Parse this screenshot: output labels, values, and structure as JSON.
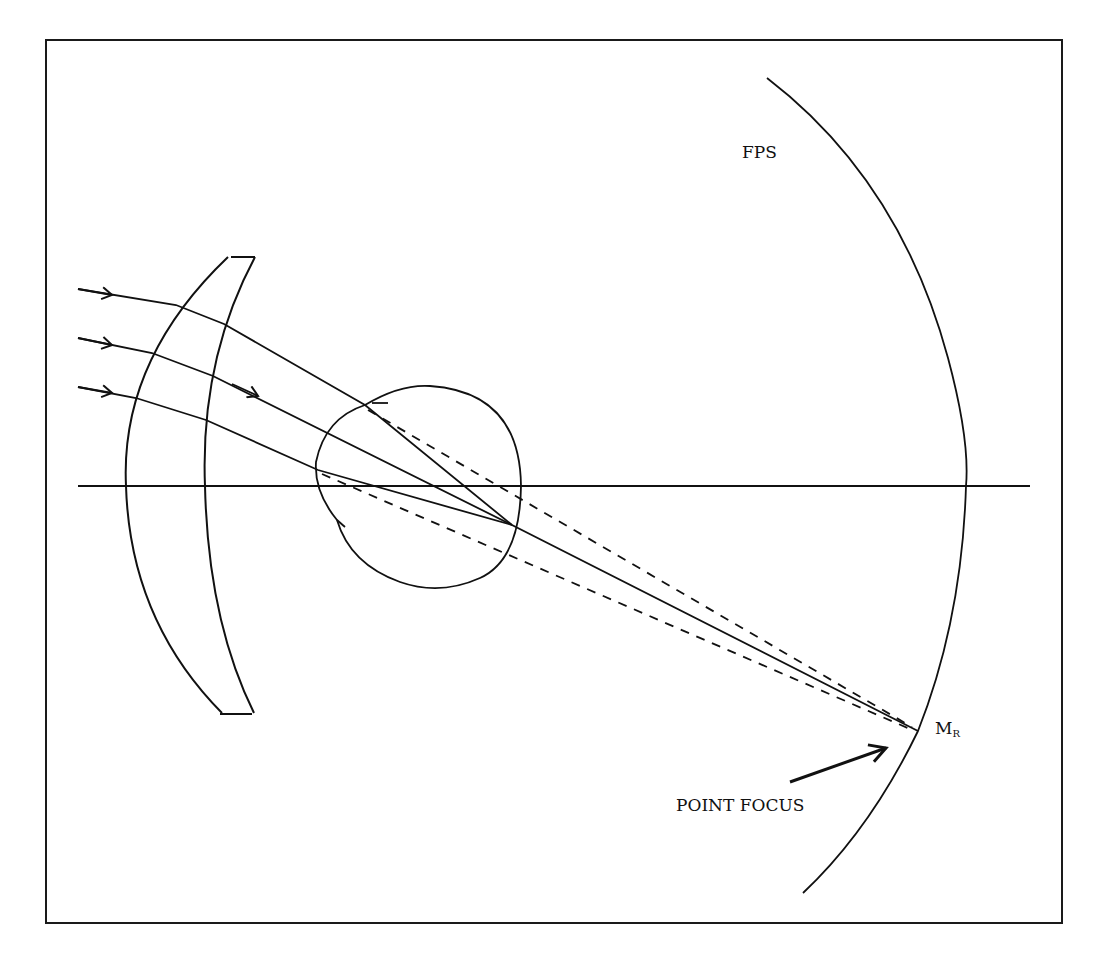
{
  "diagram": {
    "type": "optics-ray-diagram",
    "labels": {
      "far_point_sphere": "FPS",
      "focus_point_main": "M",
      "focus_point_sub": "R",
      "point_focus": "POINT FOCUS"
    },
    "elements": {
      "frame": "border rectangle",
      "optical_axis": "horizontal line",
      "spectacle_lens": "meniscus lens",
      "eye": "circular eye outline with cornea",
      "far_point_sphere": "large arc",
      "incident_rays": 3,
      "solid_refracted_rays": 3,
      "dashed_rays": 2,
      "pointer_arrow": "arrow toward M_R"
    },
    "colors": {
      "stroke": "#111111",
      "background": "#ffffff"
    }
  }
}
